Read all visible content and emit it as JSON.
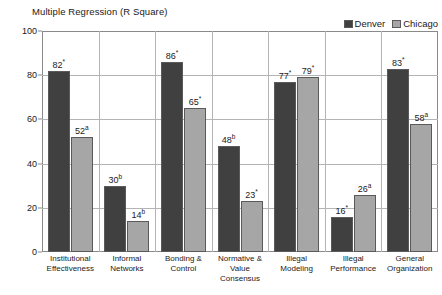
{
  "chart_data": {
    "type": "bar",
    "title": "Multiple Regression (R Square)",
    "xlabel": "",
    "ylabel": "",
    "ylim": [
      0,
      100
    ],
    "yticks": [
      0,
      20,
      40,
      60,
      80,
      100
    ],
    "grid": true,
    "legend_position": "top-right",
    "categories": [
      "Institutional Effectiveness",
      "Informal Networks",
      "Bonding & Control",
      "Normative & Value Consensus",
      "Illegal Modeling",
      "Illegal Performance",
      "General Organization"
    ],
    "series": [
      {
        "name": "Denver",
        "color": "#404040",
        "values": [
          82,
          30,
          86,
          48,
          77,
          16,
          83
        ]
      },
      {
        "name": "Chicago",
        "color": "#a6a6a6",
        "values": [
          52,
          14,
          65,
          23,
          79,
          26,
          58
        ]
      }
    ],
    "point_labels": [
      {
        "denver": "82",
        "denver_mark": "*",
        "chicago": "52",
        "chicago_mark": "a"
      },
      {
        "denver": "30",
        "denver_mark": "b",
        "chicago": "14",
        "chicago_mark": "b"
      },
      {
        "denver": "86",
        "denver_mark": "*",
        "chicago": "65",
        "chicago_mark": "*"
      },
      {
        "denver": "48",
        "denver_mark": "b",
        "chicago": "23",
        "chicago_mark": "*"
      },
      {
        "denver": "77",
        "denver_mark": "*",
        "chicago": "79",
        "chicago_mark": "*"
      },
      {
        "denver": "16",
        "denver_mark": "*",
        "chicago": "26",
        "chicago_mark": "a"
      },
      {
        "denver": "83",
        "denver_mark": "*",
        "chicago": "58",
        "chicago_mark": "a"
      }
    ]
  },
  "legend": {
    "items": [
      {
        "label": "Denver",
        "color": "#404040"
      },
      {
        "label": "Chicago",
        "color": "#a6a6a6"
      }
    ]
  },
  "xlabels": [
    {
      "line1": "Institutional",
      "line2": "Effectiveness"
    },
    {
      "line1": "Informal",
      "line2": "Networks"
    },
    {
      "line1": "Bonding &",
      "line2": "Control"
    },
    {
      "line1": "Normative &",
      "line2": "Value Consensus"
    },
    {
      "line1": "Illegal",
      "line2": "Modeling"
    },
    {
      "line1": "Illegal",
      "line2": "Performance"
    },
    {
      "line1": "General",
      "line2": "Organization"
    }
  ]
}
